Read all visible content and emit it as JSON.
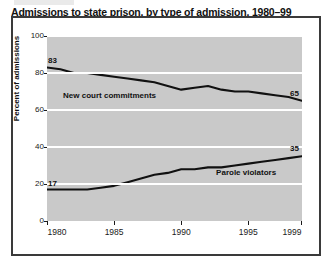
{
  "figure": {
    "title": "Admissions to state prison, by type of admission, 1980–99"
  },
  "axes": {
    "ylabel": "Percent of admissions",
    "yticks": [
      "0",
      "20",
      "40",
      "60",
      "80",
      "100"
    ],
    "xticks": [
      "1980",
      "1985",
      "1990",
      "1995",
      "1999"
    ]
  },
  "annotations": {
    "new_court_start": "83",
    "new_court_end": "65",
    "parole_start": "17",
    "parole_end": "35",
    "new_court_label": "New court commitments",
    "parole_label": "Parole violators"
  },
  "chart_data": {
    "type": "line",
    "title": "Admissions to state prison, by type of admission, 1980–99",
    "xlabel": "",
    "ylabel": "Percent of admissions",
    "xlim": [
      1980,
      1999
    ],
    "ylim": [
      0,
      100
    ],
    "yticks": [
      0,
      20,
      40,
      60,
      80,
      100
    ],
    "xticks": [
      1980,
      1985,
      1990,
      1995,
      1999
    ],
    "grid": "horizontal-white",
    "legend": "inline-labels",
    "x": [
      1980,
      1981,
      1982,
      1983,
      1984,
      1985,
      1986,
      1987,
      1988,
      1989,
      1990,
      1991,
      1992,
      1993,
      1994,
      1995,
      1996,
      1997,
      1998,
      1999
    ],
    "series": [
      {
        "name": "New court commitments",
        "color": "#111111",
        "start_label": 83,
        "end_label": 65,
        "values": [
          83,
          82,
          80,
          80,
          79,
          78,
          77,
          76,
          75,
          73,
          71,
          72,
          73,
          71,
          70,
          70,
          69,
          68,
          67,
          65
        ]
      },
      {
        "name": "Parole violators",
        "color": "#111111",
        "start_label": 17,
        "end_label": 35,
        "values": [
          17,
          17,
          17,
          17,
          18,
          19,
          21,
          23,
          25,
          26,
          28,
          28,
          29,
          29,
          30,
          31,
          32,
          33,
          34,
          35
        ]
      }
    ]
  }
}
